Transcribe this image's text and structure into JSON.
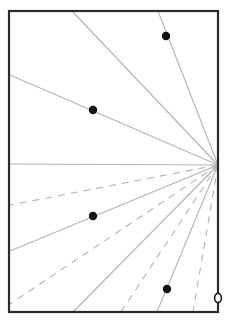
{
  "diagram": {
    "canvas": {
      "width": 226,
      "height": 321,
      "background": "#ffffff"
    },
    "frame": {
      "x1": 9,
      "y1": 11,
      "x2": 218,
      "y2": 312,
      "stroke": "#2b2b2b",
      "stroke_width": 2.2
    },
    "origin": {
      "x": 218,
      "y": 165
    },
    "ray_color": "#b4b4b4",
    "rays": [
      {
        "x": 72,
        "y": 11,
        "style": "solid"
      },
      {
        "x": 158,
        "y": 11,
        "style": "solid"
      },
      {
        "x": 10,
        "y": 75,
        "style": "solid"
      },
      {
        "x": 10,
        "y": 164,
        "style": "solid"
      },
      {
        "x": 10,
        "y": 205,
        "style": "dashed"
      },
      {
        "x": 10,
        "y": 251,
        "style": "solid"
      },
      {
        "x": 10,
        "y": 304,
        "style": "dashed"
      },
      {
        "x": 73,
        "y": 312,
        "style": "solid"
      },
      {
        "x": 121,
        "y": 312,
        "style": "dashed"
      },
      {
        "x": 157,
        "y": 312,
        "style": "solid"
      },
      {
        "x": 193,
        "y": 312,
        "style": "dashed"
      }
    ],
    "points": [
      {
        "x": 166,
        "y": 36,
        "r": 4.2,
        "type": "filled"
      },
      {
        "x": 93,
        "y": 110,
        "r": 4.2,
        "type": "filled"
      },
      {
        "x": 93,
        "y": 216,
        "r": 4.2,
        "type": "filled"
      },
      {
        "x": 167,
        "y": 289,
        "r": 4.2,
        "type": "filled"
      }
    ],
    "hollow_point": {
      "x": 218,
      "y": 298,
      "rx": 3.4,
      "ry": 4.6,
      "stroke": "#1a1a1a"
    },
    "point_color": "#111111"
  }
}
